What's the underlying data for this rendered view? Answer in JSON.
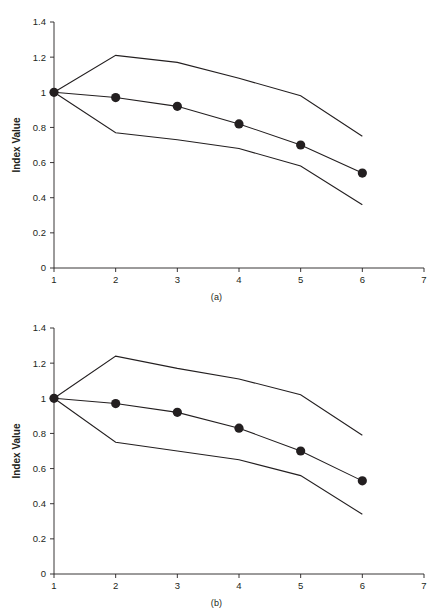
{
  "figure": {
    "panels": [
      {
        "caption": "(a)",
        "xlabel": "Time Step",
        "ylabel": "Index Value",
        "xticks": [
          "1",
          "2",
          "3",
          "4",
          "5",
          "6",
          "7"
        ],
        "yticks": [
          "0",
          "0.2",
          "0.4",
          "0.6",
          "0.8",
          "1",
          "1.2",
          "1.4"
        ]
      },
      {
        "caption": "(b)",
        "xlabel": "Time Step",
        "ylabel": "Index Value",
        "xticks": [
          "1",
          "2",
          "3",
          "4",
          "5",
          "6",
          "7"
        ],
        "yticks": [
          "0",
          "0.2",
          "0.4",
          "0.6",
          "0.8",
          "1",
          "1.2",
          "1.4"
        ]
      }
    ]
  },
  "colors": {
    "line": "#231f20",
    "marker": "#231f20",
    "axis": "#231f20",
    "background": "#ffffff"
  },
  "chart_data": [
    {
      "type": "line",
      "title": "(a)",
      "xlabel": "Time Step",
      "ylabel": "Index Value",
      "xlim": [
        1,
        7
      ],
      "ylim": [
        0,
        1.4
      ],
      "xticks": [
        1,
        2,
        3,
        4,
        5,
        6,
        7
      ],
      "yticks": [
        0,
        0.2,
        0.4,
        0.6,
        0.8,
        1.0,
        1.2,
        1.4
      ],
      "grid": false,
      "legend": "none",
      "x": [
        1,
        2,
        3,
        4,
        5,
        6
      ],
      "series": [
        {
          "name": "Upper bound",
          "values": [
            1.0,
            1.21,
            1.17,
            1.08,
            0.98,
            0.75
          ],
          "markers": false
        },
        {
          "name": "Mean index",
          "values": [
            1.0,
            0.97,
            0.92,
            0.82,
            0.7,
            0.54
          ],
          "markers": true
        },
        {
          "name": "Lower bound",
          "values": [
            1.0,
            0.77,
            0.73,
            0.68,
            0.58,
            0.36
          ],
          "markers": false
        }
      ]
    },
    {
      "type": "line",
      "title": "(b)",
      "xlabel": "Time Step",
      "ylabel": "Index Value",
      "xlim": [
        1,
        7
      ],
      "ylim": [
        0,
        1.4
      ],
      "xticks": [
        1,
        2,
        3,
        4,
        5,
        6,
        7
      ],
      "yticks": [
        0,
        0.2,
        0.4,
        0.6,
        0.8,
        1.0,
        1.2,
        1.4
      ],
      "grid": false,
      "legend": "none",
      "x": [
        1,
        2,
        3,
        4,
        5,
        6
      ],
      "series": [
        {
          "name": "Upper bound",
          "values": [
            1.0,
            1.24,
            1.17,
            1.11,
            1.02,
            0.79
          ],
          "markers": false
        },
        {
          "name": "Mean index",
          "values": [
            1.0,
            0.97,
            0.92,
            0.83,
            0.7,
            0.53
          ],
          "markers": true
        },
        {
          "name": "Lower bound",
          "values": [
            1.0,
            0.75,
            0.7,
            0.65,
            0.56,
            0.34
          ],
          "markers": false
        }
      ]
    }
  ]
}
